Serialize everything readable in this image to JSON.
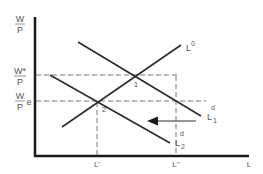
{
  "diagram": {
    "type": "labor-market supply-demand",
    "colors": {
      "line": "#2a2a2a",
      "dashed": "#777777",
      "label": "#555555",
      "background": "#ffffff"
    },
    "axes": {
      "y_label_num": "W",
      "y_label_den": "P",
      "x_label": "L"
    },
    "y_ticks": [
      {
        "num": "W*",
        "den": "P",
        "suffix": ""
      },
      {
        "num": "W",
        "den": "P",
        "suffix": "e"
      }
    ],
    "x_ticks": [
      {
        "label": "L'"
      },
      {
        "label": "L''"
      }
    ],
    "curves": [
      {
        "id": "supply",
        "base": "L",
        "sup": "0",
        "sub": ""
      },
      {
        "id": "demand-1",
        "base": "L",
        "sup": "d",
        "sub": "1"
      },
      {
        "id": "demand-2",
        "base": "L",
        "sup": "d",
        "sub": "2"
      }
    ],
    "points": [
      {
        "label": "1"
      },
      {
        "label": "2"
      }
    ],
    "arrow": {
      "direction": "left",
      "meaning": "shift of labor demand"
    }
  }
}
